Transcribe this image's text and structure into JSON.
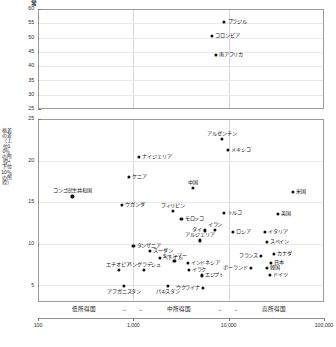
{
  "figure": {
    "corner_mark": "常",
    "background": "#ffffff",
    "point_color": "#111111",
    "frame_color": "#9b9b9b",
    "grid_color": "#d8d8d8"
  },
  "chart_data": {
    "type": "scatter",
    "title": "",
    "xlabel": "",
    "ylabel": "格差の差（上位10％の所得÷下位10％の所得）",
    "xscale": "log",
    "xlim": [
      100,
      100000
    ],
    "xticks": [
      100,
      1000,
      10000,
      100000
    ],
    "xtick_labels": [
      "100",
      "1,000",
      "10,000",
      "100,000"
    ],
    "grid": true,
    "legend": "none",
    "panels": [
      {
        "name": "upper-panel",
        "ylim": [
          25,
          60
        ],
        "yticks": [
          25,
          30,
          35,
          40,
          45,
          50,
          55,
          60
        ],
        "ytick_labels": [
          "25",
          "30",
          "35",
          "40",
          "45",
          "50",
          "55",
          "60"
        ],
        "points": [
          {
            "label": "ブラジル",
            "x": 9000,
            "y": 55.5,
            "label_pos": "right"
          },
          {
            "label": "コロンビア",
            "x": 6700,
            "y": 50.5,
            "label_pos": "right"
          },
          {
            "label": "南アフリカ",
            "x": 7300,
            "y": 44.0,
            "label_pos": "right"
          }
        ]
      },
      {
        "name": "lower-panel",
        "ylim": [
          3,
          25
        ],
        "yticks": [
          5,
          10,
          15,
          20,
          25
        ],
        "ytick_labels": [
          "5",
          "10",
          "15",
          "20",
          "25"
        ],
        "points": [
          {
            "label": "アルゼンチン",
            "x": 8500,
            "y": 22.6,
            "label_pos": "above"
          },
          {
            "label": "メキシコ",
            "x": 9800,
            "y": 21.3,
            "label_pos": "right"
          },
          {
            "label": "ナイジェリア",
            "x": 1150,
            "y": 20.4,
            "label_pos": "right"
          },
          {
            "label": "ケニア",
            "x": 900,
            "y": 18.0,
            "label_pos": "right"
          },
          {
            "label": "中国",
            "x": 4200,
            "y": 16.7,
            "label_pos": "above"
          },
          {
            "label": "米国",
            "x": 47000,
            "y": 16.2,
            "label_pos": "right"
          },
          {
            "label": "コンゴ民主共和国",
            "x": 230,
            "y": 15.7,
            "label_pos": "above"
          },
          {
            "label": "ウガンダ",
            "x": 760,
            "y": 14.7,
            "label_pos": "right"
          },
          {
            "label": "フィリピン",
            "x": 2600,
            "y": 14.0,
            "label_pos": "above"
          },
          {
            "label": "トルコ",
            "x": 9000,
            "y": 13.7,
            "label_pos": "right"
          },
          {
            "label": "英国",
            "x": 33000,
            "y": 13.6,
            "label_pos": "right"
          },
          {
            "label": "モロッコ",
            "x": 3200,
            "y": 13.0,
            "label_pos": "right"
          },
          {
            "label": "タイ",
            "x": 5600,
            "y": 11.6,
            "label_pos": "left"
          },
          {
            "label": "イラン",
            "x": 7200,
            "y": 11.7,
            "label_pos": "above"
          },
          {
            "label": "ロシア",
            "x": 11000,
            "y": 11.4,
            "label_pos": "right"
          },
          {
            "label": "イタリア",
            "x": 24000,
            "y": 11.4,
            "label_pos": "right"
          },
          {
            "label": "アルジェリア",
            "x": 5000,
            "y": 10.4,
            "label_pos": "above"
          },
          {
            "label": "スペイン",
            "x": 25000,
            "y": 10.2,
            "label_pos": "right"
          },
          {
            "label": "タンザニア",
            "x": 1000,
            "y": 9.7,
            "label_pos": "right"
          },
          {
            "label": "スーダン",
            "x": 1500,
            "y": 9.1,
            "label_pos": "right"
          },
          {
            "label": "カナダ",
            "x": 30000,
            "y": 8.8,
            "label_pos": "right"
          },
          {
            "label": "フランス",
            "x": 22000,
            "y": 8.5,
            "label_pos": "left"
          },
          {
            "label": "ベトナム",
            "x": 1900,
            "y": 8.3,
            "label_pos": "right"
          },
          {
            "label": "ミャンマー",
            "x": 2700,
            "y": 7.9,
            "label_pos": "above"
          },
          {
            "label": "インドネシア",
            "x": 3700,
            "y": 7.7,
            "label_pos": "right"
          },
          {
            "label": "日本",
            "x": 28000,
            "y": 7.7,
            "label_pos": "right"
          },
          {
            "label": "ポーランド",
            "x": 17000,
            "y": 7.1,
            "label_pos": "left"
          },
          {
            "label": "韓国",
            "x": 25000,
            "y": 7.1,
            "label_pos": "right"
          },
          {
            "label": "エチオピア",
            "x": 700,
            "y": 6.9,
            "label_pos": "above"
          },
          {
            "label": "バングラデシュ",
            "x": 1300,
            "y": 6.9,
            "label_pos": "above"
          },
          {
            "label": "イラク",
            "x": 3800,
            "y": 6.9,
            "label_pos": "right"
          },
          {
            "label": "ドイツ",
            "x": 27000,
            "y": 6.3,
            "label_pos": "right"
          },
          {
            "label": "エジプト",
            "x": 5200,
            "y": 6.2,
            "label_pos": "right"
          },
          {
            "label": "アフガニスタン",
            "x": 800,
            "y": 4.9,
            "label_pos": "below"
          },
          {
            "label": "パキスタン",
            "x": 2300,
            "y": 4.9,
            "label_pos": "below"
          },
          {
            "label": "ウクライナ",
            "x": 5400,
            "y": 4.7,
            "label_pos": "left"
          }
        ]
      }
    ],
    "income_bands": [
      {
        "label": "低所得国",
        "arrow_right": "→",
        "arrow_left": "←"
      },
      {
        "label": "中所得国",
        "arrow_right": "→",
        "arrow_left": "←"
      },
      {
        "label": "高所得国",
        "arrow_right": "",
        "arrow_left": ""
      }
    ]
  }
}
